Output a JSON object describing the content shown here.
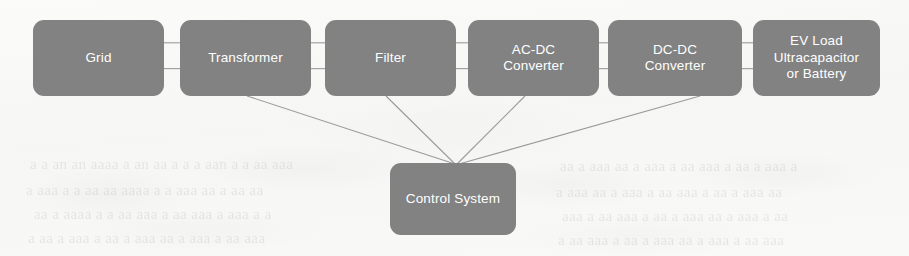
{
  "diagram": {
    "type": "block-flow-diagram",
    "background_color": "#f8f8f7",
    "node_fill_color": "#828282",
    "node_text_color": "#ffffff",
    "connector_color": "#9a9a9a",
    "stage_nodes": [
      {
        "id": "grid",
        "label": "Grid",
        "x": 33,
        "y": 20,
        "w": 131,
        "h": 76
      },
      {
        "id": "transformer",
        "label": "Transformer",
        "x": 180,
        "y": 20,
        "w": 131,
        "h": 76
      },
      {
        "id": "filter",
        "label": "Filter",
        "x": 325,
        "y": 20,
        "w": 131,
        "h": 76
      },
      {
        "id": "ac-dc",
        "label": "AC-DC\nConverter",
        "x": 468,
        "y": 20,
        "w": 131,
        "h": 76
      },
      {
        "id": "dc-dc",
        "label": "DC-DC\nConverter",
        "x": 608,
        "y": 20,
        "w": 134,
        "h": 76
      },
      {
        "id": "ev-load",
        "label": "EV Load\nUltracapacitor\nor Battery",
        "x": 753,
        "y": 20,
        "w": 127,
        "h": 76
      }
    ],
    "control_node": {
      "id": "control-system",
      "label": "Control System",
      "x": 390,
      "y": 163,
      "w": 126,
      "h": 72
    },
    "series_connectors": [
      {
        "from": "grid",
        "to": "transformer"
      },
      {
        "from": "transformer",
        "to": "filter"
      },
      {
        "from": "filter",
        "to": "ac-dc"
      },
      {
        "from": "ac-dc",
        "to": "dc-dc"
      },
      {
        "from": "dc-dc",
        "to": "ev-load"
      }
    ],
    "control_links": [
      {
        "from": "transformer",
        "to": "control-system",
        "x1": 247,
        "y1": 96,
        "x2": 455,
        "y2": 164
      },
      {
        "from": "filter",
        "to": "control-system",
        "x1": 386,
        "y1": 96,
        "x2": 455,
        "y2": 164
      },
      {
        "from": "ac-dc",
        "to": "control-system",
        "x1": 525,
        "y1": 96,
        "x2": 457,
        "y2": 164
      },
      {
        "from": "dc-dc",
        "to": "control-system",
        "x1": 700,
        "y1": 96,
        "x2": 459,
        "y2": 164
      }
    ],
    "background_ghost_lines": [
      {
        "text": "a a an  an  aaaa   a  an  aa   a   a a   aan  a  a aa  aaa",
        "x": 30,
        "y": 156
      },
      {
        "text": "a  aaa  a   a aa  aa    aaaa  a   a aaa  aa    a  aa   aa",
        "x": 26,
        "y": 182
      },
      {
        "text": "aa  a   aaaa  a  a   aa  aaa   a  aa   aaa  a  aaa  a   a",
        "x": 34,
        "y": 206
      },
      {
        "text": "a aa   a  aaa   a   aa  a  aaa  aa   a  aaa   a  aa  aaa",
        "x": 28,
        "y": 230
      },
      {
        "text": "aa a  aaa   aa  a   aaa  a  aa   aaa  a   aa  a  aaa  a",
        "x": 560,
        "y": 158
      },
      {
        "text": "a  aaa  aa   a  aaa   a  aa  aaa   a  aa  a   aaa  aa",
        "x": 556,
        "y": 184
      },
      {
        "text": "aaa  a  aa   aaa  a  aa   a  aaa  aa   a  aaa   a  aa",
        "x": 562,
        "y": 208
      },
      {
        "text": "a  aa  aaa   a  aa  a   aaa  aa  a   aaa  a  aa  aaa",
        "x": 558,
        "y": 232
      }
    ]
  }
}
